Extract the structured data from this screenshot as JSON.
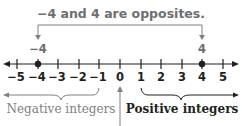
{
  "title": "−4 and 4 are opposites.",
  "marked_points": [
    {
      "label": "−4",
      "value": -4
    },
    {
      "label": "4",
      "value": 4
    }
  ],
  "number_line": {
    "min": -5,
    "max": 5,
    "ticks": [
      "−5",
      "−4",
      "−3",
      "−2",
      "−1",
      "0",
      "1",
      "2",
      "3",
      "4",
      "5"
    ]
  },
  "labels": {
    "negative": "Negative integers",
    "positive": "Positive integers"
  },
  "colors": {
    "title": "#6d6e71",
    "line": "#231f20",
    "annotation": "#808080"
  }
}
